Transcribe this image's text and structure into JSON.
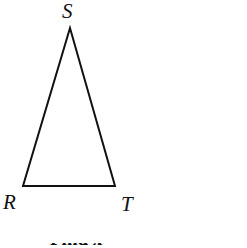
{
  "figure": {
    "type": "geometry-diagram",
    "background_color": "#ffffff",
    "stroke_color": "#111111",
    "stroke_width": 2,
    "shape": {
      "name": "triangle",
      "kind": "isosceles",
      "vertices": [
        {
          "label": "S",
          "x": 70,
          "y": 28,
          "role": "apex"
        },
        {
          "label": "R",
          "x": 23,
          "y": 186,
          "role": "base-left"
        },
        {
          "label": "T",
          "x": 115,
          "y": 186,
          "role": "base-right"
        }
      ],
      "sides": [
        "RS",
        "ST",
        "TR"
      ],
      "points_path": "70,28 23,186 115,186"
    },
    "labels": {
      "apex": "S",
      "base_left": "R",
      "base_right": "T"
    },
    "caption": {
      "text": "Find x",
      "clipped": true
    }
  }
}
